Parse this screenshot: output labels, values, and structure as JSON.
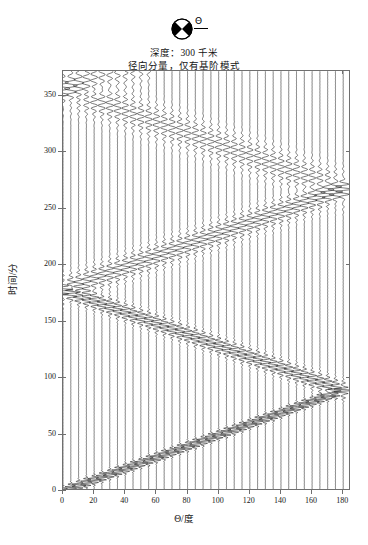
{
  "header": {
    "focal_mechanism_icon": "beachball-focal-mechanism-icon",
    "theta_symbol": "Θ",
    "line1": "深度：300 千米",
    "line2": "径向分量，仅有基阶模式"
  },
  "axes": {
    "x_title": "Θ/度",
    "y_title": "时间/分",
    "x_ticks": [
      0,
      20,
      40,
      60,
      80,
      100,
      120,
      140,
      160,
      180
    ],
    "y_ticks": [
      0,
      50,
      100,
      150,
      200,
      250,
      300,
      350
    ],
    "xlim": [
      0,
      185
    ],
    "ylim": [
      0,
      372
    ],
    "x_tick_labels": [
      "0",
      "20",
      "40",
      "60",
      "80",
      "100",
      "120",
      "140",
      "160",
      "180"
    ],
    "y_tick_labels": [
      "0",
      "50",
      "100",
      "150",
      "200",
      "250",
      "300",
      "350"
    ],
    "grid": false
  },
  "chart_data": {
    "type": "line",
    "title": "深度：300 千米 径向分量，仅有基阶模式",
    "subtitle": "径向分量，仅有基阶模式",
    "xlabel": "Θ/度",
    "ylabel": "时间/分",
    "xlim": [
      0,
      185
    ],
    "ylim": [
      0,
      372
    ],
    "trace_spacing_deg": 5,
    "trace_count": 37,
    "trace_thetas": [
      0,
      5,
      10,
      15,
      20,
      25,
      30,
      35,
      40,
      45,
      50,
      55,
      60,
      65,
      70,
      75,
      80,
      85,
      90,
      95,
      100,
      105,
      110,
      115,
      120,
      125,
      130,
      135,
      140,
      145,
      150,
      155,
      160,
      165,
      170,
      175,
      180
    ],
    "orbit_velocity_deg_per_min": 2.02,
    "branches": [
      {
        "name": "R1",
        "direction": "up",
        "t_at_theta0": 0,
        "t_at_theta180": 89
      },
      {
        "name": "R2",
        "direction": "down",
        "t_at_theta0": 178,
        "t_at_theta180": 89
      },
      {
        "name": "R3",
        "direction": "up",
        "t_at_theta0": 178,
        "t_at_theta180": 267
      },
      {
        "name": "R4",
        "direction": "down",
        "t_at_theta0": 356,
        "t_at_theta180": 267
      },
      {
        "name": "R5",
        "direction": "up",
        "t_at_theta0": 356,
        "t_at_theta180": 372
      }
    ],
    "series": [
      {
        "name": "R1",
        "x": [
          0,
          20,
          40,
          60,
          80,
          100,
          120,
          140,
          160,
          180
        ],
        "values": [
          2,
          12,
          22,
          32,
          42,
          52,
          62,
          71,
          80,
          89
        ]
      },
      {
        "name": "R2",
        "x": [
          0,
          20,
          40,
          60,
          80,
          100,
          120,
          140,
          160,
          180
        ],
        "values": [
          178,
          168,
          158,
          148,
          138,
          128,
          118,
          108,
          99,
          89
        ]
      },
      {
        "name": "R3",
        "x": [
          0,
          20,
          40,
          60,
          80,
          100,
          120,
          140,
          160,
          180
        ],
        "values": [
          180,
          190,
          200,
          210,
          220,
          230,
          240,
          249,
          258,
          267
        ]
      },
      {
        "name": "R4",
        "x": [
          0,
          20,
          40,
          60,
          80,
          100,
          120,
          140,
          160,
          180
        ],
        "values": [
          356,
          346,
          336,
          326,
          316,
          306,
          296,
          286,
          277,
          267
        ]
      },
      {
        "name": "R5",
        "x": [
          0,
          20,
          40,
          60,
          80,
          100,
          120,
          140,
          160,
          180
        ],
        "values": [
          358,
          368,
          372,
          372,
          372,
          372,
          372,
          372,
          372,
          372
        ]
      }
    ],
    "legend_position": "none"
  }
}
